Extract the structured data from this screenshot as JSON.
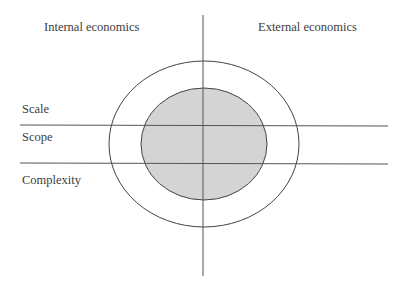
{
  "diagram": {
    "quadrant_labels": {
      "top_left": "Internal economics",
      "top_right": "External economics"
    },
    "row_labels": [
      "Scale",
      "Scope",
      "Complexity"
    ],
    "shapes": {
      "outer_ellipse": {
        "cx": 203,
        "cy": 144,
        "rx": 95,
        "ry": 83,
        "fill": "none"
      },
      "inner_ellipse": {
        "cx": 204,
        "cy": 144,
        "rx": 63,
        "ry": 56,
        "fill": "#d4d4d4"
      },
      "vertical_axis": {
        "x": 203,
        "y1": 15,
        "y2": 276
      },
      "horizontal_lines": [
        {
          "y": 125,
          "x1": 20,
          "x2": 388
        },
        {
          "y": 163,
          "x1": 20,
          "x2": 388
        }
      ]
    },
    "colors": {
      "line": "#444444",
      "fill": "#d4d4d4",
      "background": "#ffffff"
    }
  }
}
